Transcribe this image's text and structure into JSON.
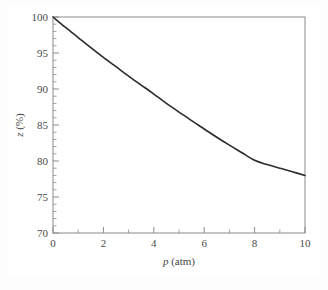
{
  "figure": {
    "background_color": "#fdfdfd",
    "plot_background_color": "#ffffff",
    "axis_color": "#8a8a8a",
    "curve_color": "#2b2b2b",
    "tick_label_color": "#4a4a4a"
  },
  "chart_data": {
    "type": "line",
    "title": "",
    "subtitle": "",
    "xlabel": "p (atm)",
    "xlabel_symbol": "p",
    "xlabel_units": "(atm)",
    "ylabel": "z (%)",
    "ylabel_symbol": "z",
    "ylabel_units": "(%)",
    "xlim": [
      0,
      10
    ],
    "ylim": [
      70,
      100
    ],
    "x_major_ticks": [
      0,
      2,
      4,
      6,
      8,
      10
    ],
    "x_major_tick_labels": [
      "0",
      "2",
      "4",
      "6",
      "8",
      "10"
    ],
    "x_minor_ticks": [
      1,
      3,
      5,
      7,
      9
    ],
    "y_major_ticks": [
      70,
      75,
      80,
      85,
      90,
      95,
      100
    ],
    "y_major_tick_labels": [
      "70",
      "75",
      "80",
      "85",
      "90",
      "95",
      "100"
    ],
    "y_minor_ticks": [
      71,
      72,
      73,
      74,
      76,
      77,
      78,
      79,
      81,
      82,
      83,
      84,
      86,
      87,
      88,
      89,
      91,
      92,
      93,
      94,
      96,
      97,
      98,
      99
    ],
    "grid": false,
    "legend": false,
    "legend_position": "none",
    "annotations": [],
    "series": [
      {
        "name": "z",
        "x": [
          0.0,
          0.5,
          1.0,
          1.5,
          2.0,
          2.5,
          3.0,
          3.5,
          4.0,
          4.5,
          5.0,
          5.5,
          6.0,
          6.5,
          7.0,
          7.5,
          8.0,
          8.5,
          9.0,
          9.5,
          10.0
        ],
        "values": [
          100.0,
          98.55,
          97.15,
          95.75,
          94.4,
          93.1,
          91.8,
          90.55,
          89.3,
          88.0,
          86.8,
          85.6,
          84.45,
          83.3,
          82.2,
          81.15,
          80.1,
          79.5,
          79.0,
          78.5,
          78.0
        ]
      }
    ]
  }
}
